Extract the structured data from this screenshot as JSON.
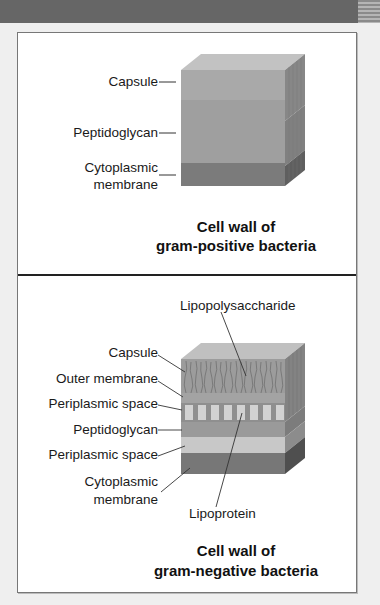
{
  "figure": {
    "panels": [
      {
        "id": "gram-positive",
        "caption_line1": "Cell wall of",
        "caption_line2": "gram-positive bacteria",
        "labels": {
          "capsule": "Capsule",
          "peptidoglycan": "Peptidoglycan",
          "cytoplasmic_line1": "Cytoplasmic",
          "cytoplasmic_line2": "membrane"
        },
        "layers": [
          {
            "name": "Capsule",
            "color": "#a9a9a9"
          },
          {
            "name": "Peptidoglycan",
            "color": "#9f9f9f"
          },
          {
            "name": "Cytoplasmic membrane",
            "color": "#7b7b7b"
          }
        ]
      },
      {
        "id": "gram-negative",
        "caption_line1": "Cell wall of",
        "caption_line2": "gram-negative bacteria",
        "labels": {
          "lipopolysaccharide": "Lipopolysaccharide",
          "capsule": "Capsule",
          "outer_membrane": "Outer membrane",
          "periplasmic_space_1": "Periplasmic space",
          "peptidoglycan": "Peptidoglycan",
          "periplasmic_space_2": "Periplasmic space",
          "cytoplasmic_line1": "Cytoplasmic",
          "cytoplasmic_line2": "membrane",
          "lipoprotein": "Lipoprotein"
        },
        "layers": [
          {
            "name": "Capsule / Lipopolysaccharide",
            "color": "#9c9c9c"
          },
          {
            "name": "Outer membrane",
            "color": "#a3a3a3"
          },
          {
            "name": "Periplasmic space",
            "color": "#c4c4c4"
          },
          {
            "name": "Peptidoglycan",
            "color": "#9a9a9a"
          },
          {
            "name": "Periplasmic space",
            "color": "#c8c8c8"
          },
          {
            "name": "Cytoplasmic membrane",
            "color": "#777777"
          }
        ]
      }
    ]
  }
}
